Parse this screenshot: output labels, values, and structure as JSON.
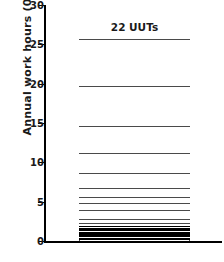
{
  "chart_data": {
    "type": "bar",
    "title": "22 UUTs",
    "xlabel": "",
    "ylabel": "Annual work hours (000)",
    "ylim": [
      0,
      30
    ],
    "yticks": [
      0,
      5,
      10,
      15,
      20,
      25,
      30
    ],
    "ytick_labels": [
      "0",
      "5",
      "10",
      "15",
      "20",
      "25",
      "30"
    ],
    "grid": false,
    "legend": "none",
    "stacked": true,
    "categories": [
      "22 UUTs"
    ],
    "total": 26.0,
    "note": "Single stacked column; 22 stacked segments (one per UUT) sorted largest at top, smallest at bottom. Cumulative boundaries read from the y-axis.",
    "cumulative_boundaries": [
      0.0,
      0.22,
      0.4,
      0.56,
      0.72,
      0.9,
      1.05,
      1.2,
      1.35,
      1.5,
      1.66,
      1.82,
      2.0,
      2.2,
      2.6,
      3.1,
      4.2,
      5.1,
      5.9,
      7.0,
      9.0,
      11.5,
      15.0,
      20.0,
      26.0
    ],
    "segments": [
      {
        "index": 22,
        "value": 6.0,
        "cumulative_top": 26.0
      },
      {
        "index": 21,
        "value": 5.0,
        "cumulative_top": 20.0
      },
      {
        "index": 20,
        "value": 3.5,
        "cumulative_top": 15.0
      },
      {
        "index": 19,
        "value": 2.5,
        "cumulative_top": 11.5
      },
      {
        "index": 18,
        "value": 2.0,
        "cumulative_top": 9.0
      },
      {
        "index": 17,
        "value": 1.1,
        "cumulative_top": 7.0
      },
      {
        "index": 16,
        "value": 0.8,
        "cumulative_top": 5.9
      },
      {
        "index": 15,
        "value": 0.9,
        "cumulative_top": 5.1
      },
      {
        "index": 14,
        "value": 1.1,
        "cumulative_top": 4.2
      },
      {
        "index": 13,
        "value": 0.5,
        "cumulative_top": 3.1
      },
      {
        "index": 12,
        "value": 0.4,
        "cumulative_top": 2.6
      },
      {
        "index": 11,
        "value": 0.2,
        "cumulative_top": 2.2
      },
      {
        "index": 10,
        "value": 0.18,
        "cumulative_top": 2.0
      },
      {
        "index": 9,
        "value": 0.16,
        "cumulative_top": 1.82
      },
      {
        "index": 8,
        "value": 0.16,
        "cumulative_top": 1.66
      },
      {
        "index": 7,
        "value": 0.15,
        "cumulative_top": 1.5
      },
      {
        "index": 6,
        "value": 0.15,
        "cumulative_top": 1.35
      },
      {
        "index": 5,
        "value": 0.15,
        "cumulative_top": 1.2
      },
      {
        "index": 4,
        "value": 0.15,
        "cumulative_top": 1.05
      },
      {
        "index": 3,
        "value": 0.18,
        "cumulative_top": 0.9
      },
      {
        "index": 2,
        "value": 0.16,
        "cumulative_top": 0.72
      },
      {
        "index": 1,
        "value": 0.16,
        "cumulative_top": 0.56
      }
    ],
    "colors": {
      "bar_fill": "#ffffff",
      "segment_border": "#4a4a4a",
      "axis": "#000000",
      "text": "#1a1a1a",
      "background": "#ffffff"
    }
  }
}
